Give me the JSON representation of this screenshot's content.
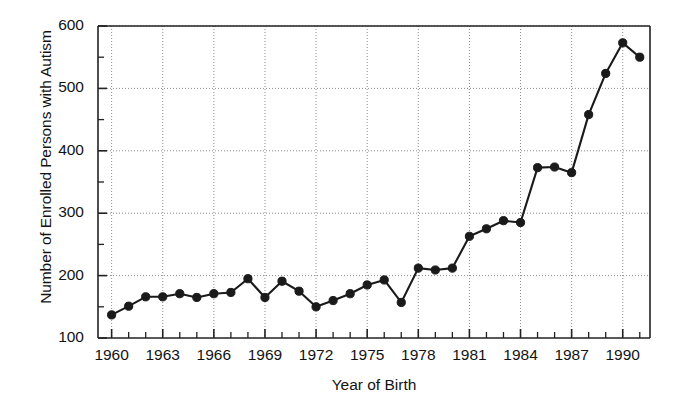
{
  "chart_data": {
    "type": "line",
    "title": "",
    "xlabel": "Year of Birth",
    "ylabel": "Number of Enrolled Persons with Autism",
    "xlim": [
      1959.2,
      1991.6
    ],
    "ylim": [
      100,
      600
    ],
    "grid": true,
    "legend": null,
    "x_major_ticks": [
      1960,
      1963,
      1966,
      1969,
      1972,
      1975,
      1978,
      1981,
      1984,
      1987,
      1990
    ],
    "x_tick_labels": [
      "1960",
      "1963",
      "1966",
      "1969",
      "1972",
      "1975",
      "1978",
      "1981",
      "1984",
      "1987",
      "1990"
    ],
    "x_minor_tick_step": 1,
    "y_major_ticks": [
      100,
      200,
      300,
      400,
      500,
      600
    ],
    "y_tick_labels": [
      "100",
      "200",
      "300",
      "400",
      "500",
      "600"
    ],
    "y_minor_tick_step": 50,
    "marker": "filled-circle",
    "line_color": "#1a1a1a",
    "marker_color": "#1a1a1a",
    "x": [
      1960,
      1961,
      1962,
      1963,
      1964,
      1965,
      1966,
      1967,
      1968,
      1969,
      1970,
      1971,
      1972,
      1973,
      1974,
      1975,
      1976,
      1977,
      1978,
      1979,
      1980,
      1981,
      1982,
      1983,
      1984,
      1985,
      1986,
      1987,
      1988,
      1989,
      1990,
      1991
    ],
    "values": [
      137,
      151,
      166,
      166,
      171,
      165,
      171,
      173,
      195,
      165,
      191,
      175,
      150,
      160,
      171,
      185,
      193,
      157,
      212,
      209,
      212,
      263,
      275,
      288,
      285,
      373,
      374,
      365,
      458,
      524,
      573,
      550
    ]
  }
}
